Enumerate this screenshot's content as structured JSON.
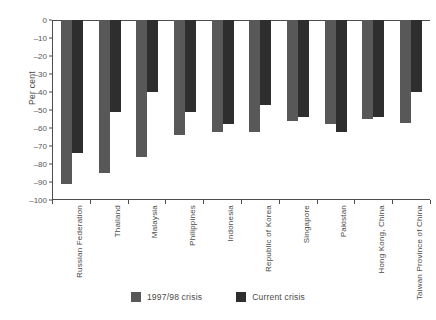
{
  "chart_data": {
    "type": "bar",
    "title": "",
    "subtitle": "",
    "xlabel": "",
    "ylabel": "Per cent",
    "ylim": [
      -100,
      0
    ],
    "yticks": [
      0,
      -10,
      -20,
      -30,
      -40,
      -50,
      -60,
      -70,
      -80,
      -90,
      -100
    ],
    "ytick_labels": [
      "0",
      "-10",
      "-20",
      "-30",
      "-40",
      "-50",
      "-60",
      "-70",
      "-80",
      "-90",
      "-100"
    ],
    "grid": false,
    "legend_position": "bottom-center",
    "categories": [
      "Russian Federation",
      "Thailand",
      "Malaysia",
      "Philippines",
      "Indonesia",
      "Republic of Korea",
      "Singapore",
      "Pakistan",
      "Hong Kong, China",
      "Taiwan Province of China"
    ],
    "series": [
      {
        "name": "1997/98 crisis",
        "color": "#585858",
        "values": [
          -91,
          -85,
          -76,
          -64,
          -62,
          -62,
          -56,
          -58,
          -55,
          -57
        ]
      },
      {
        "name": "Current crisis",
        "color": "#2e2e2e",
        "values": [
          -74,
          -51,
          -40,
          -51,
          -58,
          -47,
          -54,
          -62,
          -54,
          -40
        ]
      }
    ]
  },
  "legend": {
    "items": [
      {
        "label": "1997/98 crisis",
        "color": "#585858"
      },
      {
        "label": "Current crisis",
        "color": "#2e2e2e"
      }
    ]
  }
}
